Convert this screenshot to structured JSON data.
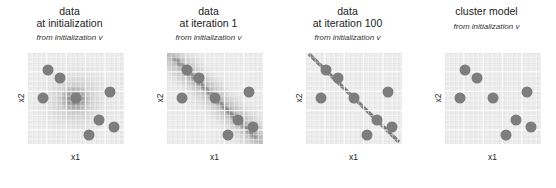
{
  "figure": {
    "background": "#ffffff",
    "dot_color": "#7d7d7d",
    "plot_background": "#ececec",
    "grid_color": "#ffffff"
  },
  "chart_data": {
    "type": "scatter",
    "title": "",
    "xlabel": "x1",
    "ylabel": "x2",
    "xlim": [
      0,
      1
    ],
    "ylim": [
      0,
      1
    ],
    "grid": true,
    "legend": null,
    "panels": [
      {
        "title_lines": [
          "data",
          "at initialization"
        ],
        "subtitle": "from initialization v",
        "xlabel": "x1",
        "ylabel": "x2",
        "overlay": "isotropic-gaussian-blob",
        "overlay_description": "broad diffuse gray density centered mid-plot",
        "points": [
          {
            "x": 0.22,
            "y": 0.8
          },
          {
            "x": 0.34,
            "y": 0.72
          },
          {
            "x": 0.17,
            "y": 0.5
          },
          {
            "x": 0.5,
            "y": 0.5
          },
          {
            "x": 0.86,
            "y": 0.56
          },
          {
            "x": 0.74,
            "y": 0.26
          },
          {
            "x": 0.9,
            "y": 0.18
          },
          {
            "x": 0.64,
            "y": 0.1
          }
        ]
      },
      {
        "title_lines": [
          "data",
          "at iteration 1"
        ],
        "subtitle": "from initialization v",
        "xlabel": "x1",
        "ylabel": "x2",
        "overlay": "diagonal-band",
        "overlay_description": "wide blurred negative-slope diagonal band from top-left to bottom-right",
        "points": [
          {
            "x": 0.22,
            "y": 0.8
          },
          {
            "x": 0.34,
            "y": 0.72
          },
          {
            "x": 0.17,
            "y": 0.5
          },
          {
            "x": 0.5,
            "y": 0.5
          },
          {
            "x": 0.86,
            "y": 0.56
          },
          {
            "x": 0.74,
            "y": 0.26
          },
          {
            "x": 0.9,
            "y": 0.18
          },
          {
            "x": 0.64,
            "y": 0.1
          }
        ]
      },
      {
        "title_lines": [
          "data",
          "at iteration 100"
        ],
        "subtitle": "from initialization v",
        "xlabel": "x1",
        "ylabel": "x2",
        "overlay": "diagonal-line",
        "overlay_description": "sharp thin negative-slope line from top-left corner to bottom-right corner",
        "points": [
          {
            "x": 0.22,
            "y": 0.8
          },
          {
            "x": 0.34,
            "y": 0.72
          },
          {
            "x": 0.17,
            "y": 0.5
          },
          {
            "x": 0.5,
            "y": 0.5
          },
          {
            "x": 0.86,
            "y": 0.56
          },
          {
            "x": 0.74,
            "y": 0.26
          },
          {
            "x": 0.9,
            "y": 0.18
          },
          {
            "x": 0.64,
            "y": 0.1
          }
        ]
      },
      {
        "title_lines": [
          "cluster model"
        ],
        "subtitle": "from initialization v",
        "xlabel": "x1",
        "ylabel": "x2",
        "overlay": "none",
        "overlay_description": "plain grid, data points only",
        "points": [
          {
            "x": 0.22,
            "y": 0.8
          },
          {
            "x": 0.34,
            "y": 0.72
          },
          {
            "x": 0.17,
            "y": 0.5
          },
          {
            "x": 0.5,
            "y": 0.5
          },
          {
            "x": 0.86,
            "y": 0.56
          },
          {
            "x": 0.74,
            "y": 0.26
          },
          {
            "x": 0.9,
            "y": 0.18
          },
          {
            "x": 0.64,
            "y": 0.1
          }
        ]
      }
    ]
  }
}
